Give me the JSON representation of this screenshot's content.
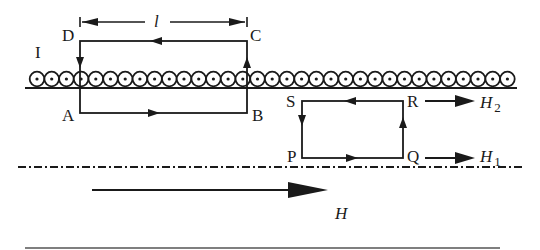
{
  "figure": {
    "region_label": "I",
    "length_label": "l",
    "loop1": {
      "corners": [
        "A",
        "B",
        "C",
        "D"
      ]
    },
    "loop2": {
      "corners": [
        "P",
        "Q",
        "R",
        "S"
      ]
    },
    "field_labels": {
      "H2": {
        "main": "H",
        "sub": "2"
      },
      "H1": {
        "main": "H",
        "sub": "1"
      },
      "H": "H"
    }
  },
  "coils": {
    "count": 33,
    "start_x": 37,
    "spacing": 14.7,
    "y": 79,
    "radius": 7.3,
    "color": "#1a1a1a"
  }
}
